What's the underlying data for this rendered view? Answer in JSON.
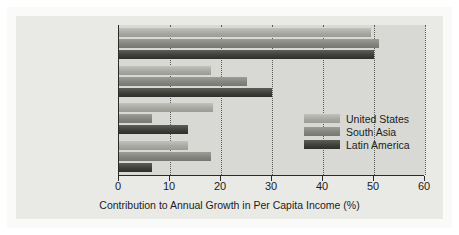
{
  "chart_data": {
    "type": "bar",
    "orientation": "horizontal",
    "title": "",
    "xlabel": "Contribution to Annual Growth in Per Capita Income (%)",
    "ylabel": "",
    "xlim": [
      0,
      60
    ],
    "xticks": [
      0,
      10,
      20,
      30,
      40,
      50,
      60
    ],
    "xtick_labels": [
      "0",
      "10",
      "20",
      "30",
      "40",
      "50",
      "60"
    ],
    "grid": true,
    "grid_axis": "x",
    "grid_style": "dotted",
    "legend_position": "center-right inside plot",
    "categories": [
      "Labor",
      "Physical capital",
      "Education\n(human capital)",
      "Capital and labor\nproductivity"
    ],
    "series": [
      {
        "name": "United States",
        "color": "#a9a9a4",
        "values": [
          49.5,
          18.0,
          18.5,
          13.5
        ]
      },
      {
        "name": "South Asia",
        "color": "#858580",
        "values": [
          51.0,
          25.0,
          6.5,
          18.0
        ]
      },
      {
        "name": "Latin America",
        "color": "#3f3f3c",
        "values": [
          50.0,
          30.0,
          13.5,
          6.5
        ]
      }
    ]
  },
  "axis": {
    "x_title": "Contribution to Annual Growth in Per Capita Income (%)"
  },
  "legend": {
    "entries": [
      {
        "label": "United States"
      },
      {
        "label": "South Asia"
      },
      {
        "label": "Latin America"
      }
    ]
  }
}
